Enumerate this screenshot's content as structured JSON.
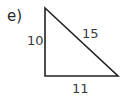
{
  "part_label": "e)",
  "triangle": {
    "type": "right-triangle",
    "vertices": [
      [
        45,
        8
      ],
      [
        45,
        76
      ],
      [
        118,
        76
      ]
    ],
    "stroke": "#222222",
    "sides": {
      "vertical": "10",
      "hypotenuse": "15",
      "base": "11"
    }
  }
}
